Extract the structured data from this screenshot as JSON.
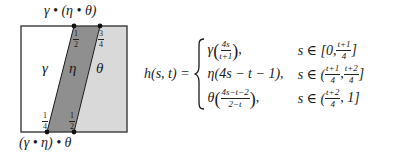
{
  "diagram": {
    "square": {
      "x": 21,
      "y": 26,
      "size": 106
    },
    "colors": {
      "stroke": "#3a3a3a",
      "left_region": "#ffffff",
      "middle_region": "#8f8f8f",
      "right_region": "#d9d9d9",
      "dot": "#111111"
    },
    "top_label": "γ • (η • θ)",
    "bottom_label": "(γ • η) • θ",
    "regions": [
      {
        "name": "gamma",
        "symbol": "γ"
      },
      {
        "name": "eta",
        "symbol": "η"
      },
      {
        "name": "theta",
        "symbol": "θ"
      }
    ],
    "top_marks": [
      {
        "num": "1",
        "den": "2"
      },
      {
        "num": "3",
        "den": "4"
      }
    ],
    "bottom_marks": [
      {
        "num": "1",
        "den": "4"
      },
      {
        "num": "1",
        "den": "2"
      }
    ]
  },
  "formula": {
    "lhs": "h(s, t) =",
    "cases": [
      {
        "func": "γ",
        "arg_num": "4s",
        "arg_den": "t+1",
        "suffix": ",",
        "cond_prefix": "s ∈ [0, ",
        "cond_a_num": "t+1",
        "cond_a_den": "4",
        "cond_suffix": "]"
      },
      {
        "expr": "η(4s − t − 1),",
        "cond_prefix": "s ∈ (",
        "cond_a_num": "t+1",
        "cond_a_den": "4",
        "cond_sep": ", ",
        "cond_b_num": "t+2",
        "cond_b_den": "4",
        "cond_suffix": "]"
      },
      {
        "func": "θ",
        "arg_num": "4s−t−2",
        "arg_den": "2−t",
        "suffix": ",",
        "cond_prefix": "s ∈ (",
        "cond_a_num": "t+2",
        "cond_a_den": "4",
        "cond_suffix": ", 1]"
      }
    ]
  }
}
